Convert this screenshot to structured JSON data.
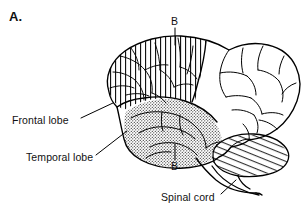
{
  "figure": {
    "panel_letter": "A.",
    "type": "anatomical-line-drawing",
    "background_color": "#ffffff",
    "ink_color": "#000000"
  },
  "labels": {
    "frontal_lobe": "Frontal lobe",
    "temporal_lobe": "Temporal lobe",
    "spinal_cord": "Spinal cord",
    "section_plane_top": "B",
    "section_plane_bottom": "B"
  },
  "regions": [
    {
      "name": "frontal-lobe",
      "label": "Frontal lobe",
      "fill_pattern": "vertical-hatch",
      "fill_color": "#000000"
    },
    {
      "name": "temporal-lobe",
      "label": "Temporal lobe",
      "fill_pattern": "stipple-dots",
      "fill_color": "#000000"
    },
    {
      "name": "cerebellum",
      "label": "",
      "fill_pattern": "diagonal-hatch",
      "fill_color": "#000000"
    },
    {
      "name": "parietal-occipital-cortex",
      "label": "",
      "fill_pattern": "none",
      "fill_color": "#ffffff"
    },
    {
      "name": "brainstem-spinal-cord",
      "label": "Spinal cord",
      "fill_pattern": "none",
      "fill_color": "#ffffff"
    }
  ]
}
